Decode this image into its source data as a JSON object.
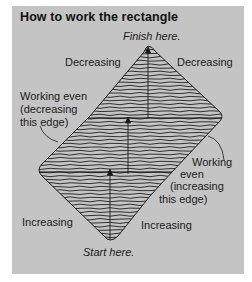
{
  "title": "How to work the rectangle",
  "labels": {
    "finish": "Finish here.",
    "start": "Start here.",
    "top_left": "Decreasing",
    "top_right": "Decreasing",
    "left_edge_1": "Working even",
    "left_edge_2": "(decreasing",
    "left_edge_3": "this edge)",
    "right_edge_1": "Working",
    "right_edge_2": "even",
    "right_edge_3": "(increasing",
    "right_edge_4": "this edge)",
    "bottom_left": "Increasing",
    "bottom_right": "Increasing"
  },
  "colors": {
    "panel": "#c4c4c4",
    "ink": "#1a1a1a"
  }
}
